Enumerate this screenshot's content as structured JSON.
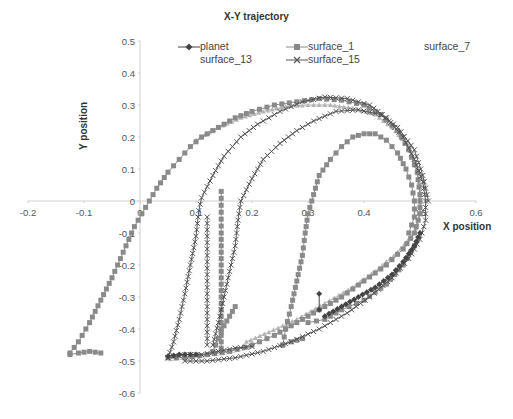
{
  "chart_data": {
    "type": "scatter",
    "title": "X-Y trajectory",
    "xlabel": "X position",
    "ylabel": "Y position",
    "xlim": [
      -0.2,
      0.6
    ],
    "ylim": [
      -0.6,
      0.5
    ],
    "xticks": [
      "-0.2",
      "-0.1",
      "0",
      "0.1",
      "0.2",
      "0.3",
      "0.4",
      "0.5",
      "0.6"
    ],
    "yticks": [
      "0.5",
      "0.4",
      "0.3",
      "0.2",
      "0.1",
      "0",
      "-0.1",
      "-0.2",
      "-0.3",
      "-0.4",
      "-0.5",
      "-0.6"
    ],
    "grid": false,
    "legend_position": "top",
    "legend": [
      "planet",
      "surface_1",
      "surface_7",
      "surface_13",
      "surface_15"
    ],
    "series": [
      {
        "name": "surface_1",
        "marker": "square",
        "color": "#8a8a8a",
        "segments": [
          [
            [
              -0.125,
              -0.475
            ],
            [
              -0.11,
              -0.44
            ],
            [
              -0.09,
              -0.38
            ],
            [
              -0.07,
              -0.31
            ],
            [
              -0.05,
              -0.24
            ],
            [
              -0.03,
              -0.16
            ],
            [
              -0.01,
              -0.08
            ],
            [
              0.01,
              -0.02
            ],
            [
              0.03,
              0.04
            ],
            [
              0.05,
              0.09
            ],
            [
              0.07,
              0.13
            ],
            [
              0.09,
              0.17
            ],
            [
              0.11,
              0.2
            ],
            [
              0.14,
              0.23
            ],
            [
              0.17,
              0.26
            ],
            [
              0.2,
              0.28
            ],
            [
              0.24,
              0.3
            ],
            [
              0.28,
              0.31
            ],
            [
              0.32,
              0.32
            ],
            [
              0.36,
              0.315
            ],
            [
              0.4,
              0.3
            ],
            [
              0.43,
              0.27
            ],
            [
              0.46,
              0.22
            ],
            [
              0.48,
              0.16
            ],
            [
              0.495,
              0.09
            ],
            [
              0.5,
              0.02
            ],
            [
              0.5,
              -0.04
            ],
            [
              0.49,
              -0.1
            ],
            [
              0.47,
              -0.15
            ],
            [
              0.44,
              -0.2
            ],
            [
              0.4,
              -0.25
            ],
            [
              0.36,
              -0.3
            ],
            [
              0.32,
              -0.34
            ],
            [
              0.28,
              -0.38
            ],
            [
              0.24,
              -0.42
            ],
            [
              0.2,
              -0.45
            ],
            [
              0.16,
              -0.47
            ],
            [
              0.12,
              -0.48
            ],
            [
              0.08,
              -0.49
            ],
            [
              0.05,
              -0.49
            ]
          ],
          [
            [
              -0.125,
              -0.48
            ],
            [
              -0.11,
              -0.475
            ],
            [
              -0.09,
              -0.47
            ],
            [
              -0.07,
              -0.475
            ]
          ],
          [
            [
              0.255,
              -0.45
            ],
            [
              0.26,
              -0.4
            ],
            [
              0.27,
              -0.33
            ],
            [
              0.28,
              -0.25
            ],
            [
              0.29,
              -0.17
            ],
            [
              0.295,
              -0.1
            ],
            [
              0.3,
              -0.04
            ],
            [
              0.31,
              0.02
            ],
            [
              0.32,
              0.08
            ],
            [
              0.34,
              0.13
            ],
            [
              0.36,
              0.17
            ],
            [
              0.38,
              0.2
            ],
            [
              0.4,
              0.21
            ],
            [
              0.42,
              0.21
            ],
            [
              0.44,
              0.19
            ],
            [
              0.46,
              0.15
            ],
            [
              0.475,
              0.1
            ],
            [
              0.485,
              0.05
            ],
            [
              0.49,
              0.0
            ],
            [
              0.49,
              -0.05
            ],
            [
              0.48,
              -0.1
            ]
          ],
          [
            [
              0.255,
              -0.45
            ],
            [
              0.27,
              -0.44
            ],
            [
              0.29,
              -0.43
            ]
          ],
          [
            [
              0.145,
              0.03
            ],
            [
              0.145,
              -0.1
            ],
            [
              0.145,
              -0.2
            ],
            [
              0.145,
              -0.3
            ],
            [
              0.145,
              -0.4
            ],
            [
              0.145,
              -0.46
            ]
          ],
          [
            [
              0.13,
              -0.47
            ],
            [
              0.14,
              -0.43
            ],
            [
              0.15,
              -0.39
            ],
            [
              0.16,
              -0.36
            ],
            [
              0.17,
              -0.33
            ]
          ],
          [
            [
              0.3,
              -0.38
            ],
            [
              0.33,
              -0.37
            ],
            [
              0.36,
              -0.34
            ],
            [
              0.4,
              -0.31
            ],
            [
              0.44,
              -0.26
            ],
            [
              0.47,
              -0.2
            ],
            [
              0.49,
              -0.14
            ]
          ]
        ]
      },
      {
        "name": "surface_15",
        "marker": "x",
        "color": "#555555",
        "segments": [
          [
            [
              0.05,
              -0.49
            ],
            [
              0.06,
              -0.44
            ],
            [
              0.07,
              -0.37
            ],
            [
              0.08,
              -0.29
            ],
            [
              0.09,
              -0.2
            ],
            [
              0.1,
              -0.11
            ],
            [
              0.105,
              -0.03
            ],
            [
              0.11,
              0.01
            ],
            [
              0.13,
              0.08
            ],
            [
              0.15,
              0.14
            ],
            [
              0.18,
              0.2
            ],
            [
              0.21,
              0.24
            ],
            [
              0.25,
              0.28
            ],
            [
              0.29,
              0.31
            ],
            [
              0.33,
              0.325
            ],
            [
              0.37,
              0.32
            ],
            [
              0.41,
              0.3
            ],
            [
              0.44,
              0.26
            ],
            [
              0.47,
              0.2
            ],
            [
              0.49,
              0.13
            ],
            [
              0.505,
              0.06
            ],
            [
              0.51,
              0.0
            ],
            [
              0.51,
              -0.06
            ],
            [
              0.5,
              -0.12
            ],
            [
              0.48,
              -0.18
            ],
            [
              0.45,
              -0.24
            ],
            [
              0.41,
              -0.3
            ],
            [
              0.37,
              -0.35
            ],
            [
              0.32,
              -0.4
            ],
            [
              0.27,
              -0.44
            ],
            [
              0.22,
              -0.47
            ],
            [
              0.17,
              -0.49
            ],
            [
              0.12,
              -0.5
            ],
            [
              0.08,
              -0.5
            ]
          ],
          [
            [
              0.13,
              -0.45
            ],
            [
              0.14,
              -0.38
            ],
            [
              0.15,
              -0.3
            ],
            [
              0.16,
              -0.22
            ],
            [
              0.17,
              -0.14
            ],
            [
              0.175,
              -0.06
            ],
            [
              0.18,
              0.0
            ],
            [
              0.2,
              0.07
            ],
            [
              0.22,
              0.13
            ],
            [
              0.25,
              0.18
            ],
            [
              0.28,
              0.22
            ],
            [
              0.31,
              0.25
            ],
            [
              0.35,
              0.28
            ],
            [
              0.39,
              0.285
            ],
            [
              0.43,
              0.27
            ],
            [
              0.46,
              0.23
            ],
            [
              0.49,
              0.16
            ],
            [
              0.505,
              0.08
            ],
            [
              0.515,
              0.0
            ]
          ],
          [
            [
              0.12,
              -0.05
            ],
            [
              0.12,
              -0.15
            ],
            [
              0.12,
              -0.25
            ],
            [
              0.12,
              -0.35
            ],
            [
              0.12,
              -0.45
            ]
          ],
          [
            [
              0.05,
              -0.49
            ],
            [
              0.08,
              -0.48
            ],
            [
              0.11,
              -0.48
            ],
            [
              0.14,
              -0.47
            ],
            [
              0.17,
              -0.46
            ],
            [
              0.2,
              -0.455
            ]
          ]
        ]
      },
      {
        "name": "surface_7",
        "marker": "triangle",
        "color": "#b5b5b5",
        "segments": [
          [
            [
              0.1,
              0.19
            ],
            [
              0.14,
              0.23
            ],
            [
              0.18,
              0.26
            ],
            [
              0.22,
              0.28
            ],
            [
              0.26,
              0.295
            ],
            [
              0.3,
              0.3
            ],
            [
              0.34,
              0.3
            ],
            [
              0.38,
              0.29
            ],
            [
              0.42,
              0.27
            ],
            [
              0.45,
              0.23
            ],
            [
              0.48,
              0.17
            ],
            [
              0.495,
              0.1
            ],
            [
              0.5,
              0.03
            ],
            [
              0.5,
              -0.04
            ],
            [
              0.49,
              -0.1
            ],
            [
              0.46,
              -0.16
            ],
            [
              0.42,
              -0.22
            ],
            [
              0.38,
              -0.27
            ],
            [
              0.33,
              -0.32
            ],
            [
              0.28,
              -0.37
            ],
            [
              0.23,
              -0.41
            ],
            [
              0.19,
              -0.44
            ]
          ]
        ]
      },
      {
        "name": "surface_13",
        "marker": "none",
        "color": "#cccccc",
        "segments": [
          [
            [
              0.05,
              -0.5
            ],
            [
              0.1,
              -0.49
            ],
            [
              0.15,
              -0.48
            ],
            [
              0.2,
              -0.46
            ]
          ]
        ]
      },
      {
        "name": "planet",
        "marker": "diamond",
        "color": "#444444",
        "segments": [
          [
            [
              0.32,
              -0.29
            ],
            [
              0.32,
              -0.34
            ]
          ],
          [
            [
              0.33,
              -0.36
            ],
            [
              0.36,
              -0.33
            ],
            [
              0.39,
              -0.3
            ],
            [
              0.42,
              -0.27
            ],
            [
              0.45,
              -0.23
            ],
            [
              0.47,
              -0.19
            ],
            [
              0.49,
              -0.14
            ],
            [
              0.5,
              -0.1
            ]
          ],
          [
            [
              0.05,
              -0.485
            ],
            [
              0.07,
              -0.48
            ],
            [
              0.1,
              -0.48
            ]
          ]
        ]
      }
    ]
  }
}
